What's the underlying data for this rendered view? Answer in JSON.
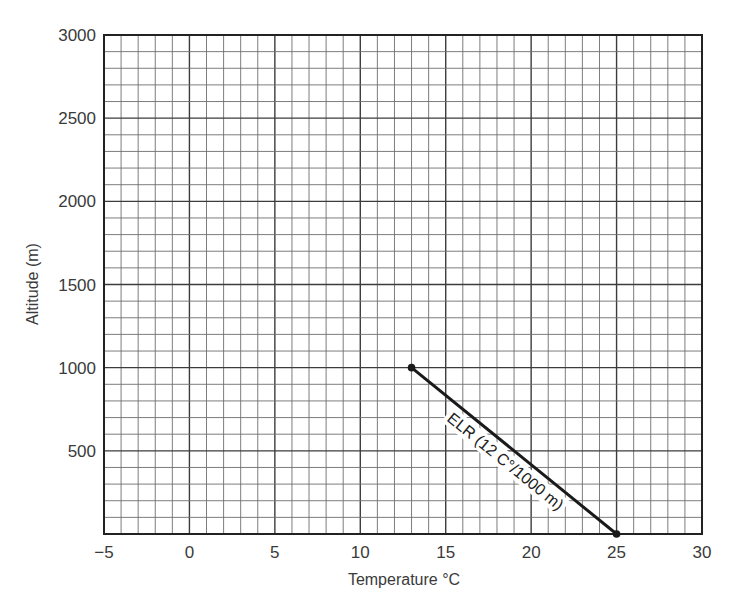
{
  "chart_data": {
    "type": "line",
    "title": "",
    "xlabel": "Temperature °C",
    "ylabel": "Altitude (m)",
    "xlim": [
      -5,
      30
    ],
    "ylim": [
      0,
      3000
    ],
    "x_ticks": [
      -5,
      0,
      5,
      10,
      15,
      20,
      25,
      30
    ],
    "x_tick_labels": [
      "−5",
      "0",
      "5",
      "10",
      "15",
      "20",
      "25",
      "30"
    ],
    "y_ticks": [
      500,
      1000,
      1500,
      2000,
      2500,
      3000
    ],
    "y_tick_labels": [
      "500",
      "1000",
      "1500",
      "2000",
      "2500",
      "3000"
    ],
    "grid": true,
    "x_minor_step": 1,
    "y_minor_step": 100,
    "legend": "none",
    "series": [
      {
        "name": "ELR (12 C°/1000 m)",
        "label": "ELR (12 C°/1000 m)",
        "x": [
          13,
          25
        ],
        "y": [
          1000,
          0
        ],
        "markers": true
      }
    ]
  },
  "colors": {
    "grid_minor": "#6e6e6e",
    "grid_major": "#3c3c3c",
    "frame": "#222222",
    "line": "#1a1a1a",
    "text": "#3a3a3a"
  }
}
